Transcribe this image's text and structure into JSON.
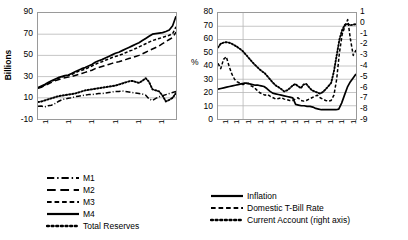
{
  "chart_data": [
    {
      "type": "line",
      "panel": "left",
      "title": "",
      "xlabel": "",
      "ylabel": "Billions",
      "ylim": [
        -10,
        90
      ],
      "yticks": [
        90,
        70,
        50,
        30,
        10,
        -10
      ],
      "grid": true,
      "legend_position": "bottom",
      "x": [
        "1990M1",
        "1990M7",
        "1991M1",
        "1991M7",
        "1992M1",
        "1992M7",
        "1993M1",
        "1993M7",
        "1994M1",
        "1994M7",
        "1995M1",
        "1995M7"
      ],
      "xticks": [
        "1990M1",
        "1991M1",
        "1992M1",
        "1993M1",
        "1994M1",
        "1995M1"
      ],
      "series": [
        {
          "name": "M1",
          "style": "dash-dot",
          "values": [
            2.0,
            2.2,
            1.5,
            2.5,
            3.0,
            4.5,
            6.5,
            8.0,
            9.0,
            9.5,
            10.0,
            11.0,
            11.5,
            12.0,
            12.5,
            13.0,
            13.0,
            13.5,
            14.0,
            14.0,
            14.5,
            15.0,
            15.5,
            16.0,
            16.0,
            16.5,
            16.0,
            15.5,
            15.0,
            14.5,
            14.0,
            13.5,
            12.5,
            9.0,
            7.5,
            9.5,
            11.0,
            12.0,
            13.0,
            14.0,
            15.0,
            16.0
          ]
        },
        {
          "name": "M2",
          "style": "long-dash",
          "values": [
            19.0,
            20.0,
            21.5,
            23.0,
            24.5,
            26.0,
            27.0,
            28.0,
            29.0,
            29.5,
            30.0,
            31.0,
            32.0,
            33.0,
            34.0,
            35.0,
            36.0,
            37.5,
            38.5,
            39.5,
            40.5,
            41.5,
            42.5,
            43.5,
            44.0,
            45.0,
            46.0,
            47.0,
            48.0,
            49.0,
            50.0,
            51.5,
            53.0,
            54.5,
            56.0,
            57.5,
            59.0,
            61.0,
            63.0,
            65.0,
            67.0,
            72.0
          ]
        },
        {
          "name": "M3",
          "style": "dash",
          "values": [
            19.5,
            20.5,
            22.0,
            24.0,
            25.5,
            27.0,
            28.5,
            29.5,
            30.5,
            31.0,
            32.0,
            33.5,
            35.0,
            36.0,
            37.0,
            38.5,
            40.0,
            41.5,
            43.0,
            44.0,
            45.5,
            46.5,
            48.0,
            49.0,
            50.0,
            51.0,
            52.5,
            54.0,
            55.0,
            56.5,
            58.0,
            59.5,
            61.0,
            62.5,
            64.0,
            65.0,
            66.0,
            67.0,
            68.0,
            69.0,
            70.5,
            77.0
          ]
        },
        {
          "name": "M4",
          "style": "solid",
          "values": [
            19.5,
            21.0,
            22.5,
            24.5,
            26.0,
            27.5,
            29.0,
            30.0,
            31.0,
            31.5,
            33.0,
            34.5,
            36.0,
            37.5,
            38.5,
            40.0,
            41.5,
            43.5,
            45.0,
            46.0,
            47.5,
            49.0,
            50.5,
            52.0,
            53.0,
            54.5,
            56.0,
            57.5,
            59.0,
            60.5,
            62.0,
            64.0,
            66.0,
            68.0,
            70.0,
            70.5,
            71.0,
            71.5,
            72.5,
            74.0,
            78.0,
            87.0
          ]
        },
        {
          "name": "Total Reserves",
          "style": "dotted",
          "values": [
            6.0,
            6.5,
            7.5,
            8.5,
            9.5,
            10.5,
            11.5,
            12.0,
            12.5,
            13.0,
            13.5,
            14.0,
            15.0,
            16.0,
            17.0,
            17.5,
            18.0,
            18.5,
            19.0,
            19.5,
            20.0,
            20.5,
            21.0,
            21.5,
            22.5,
            23.5,
            24.5,
            25.5,
            26.0,
            25.0,
            24.0,
            26.0,
            28.5,
            25.0,
            18.0,
            17.0,
            16.0,
            12.0,
            6.5,
            8.0,
            10.0,
            14.5
          ]
        }
      ]
    },
    {
      "type": "line",
      "panel": "right",
      "title": "",
      "xlabel": "",
      "ylabel": "%",
      "y2label": "Billions of U.S. dollars",
      "ylim": [
        0,
        80
      ],
      "yticks": [
        80,
        70,
        60,
        50,
        40,
        30,
        20,
        10,
        0
      ],
      "y2lim": [
        -9,
        1
      ],
      "y2ticks": [
        1,
        0,
        -1,
        -2,
        -3,
        -4,
        -5,
        -6,
        -7,
        -8,
        -9
      ],
      "grid": true,
      "legend_position": "bottom",
      "xticks": [
        "1990M1",
        "1990M7",
        "1991M1",
        "1991M7",
        "1992M1",
        "1992M7",
        "1993M1",
        "1993M7",
        "1994M1",
        "1994M7",
        "1995M1",
        "1995M7"
      ],
      "series": [
        {
          "name": "Inflation",
          "style": "solid",
          "axis": "left",
          "values": [
            22.5,
            23.0,
            23.5,
            24.0,
            24.5,
            25.0,
            25.5,
            26.0,
            26.5,
            27.0,
            27.0,
            26.5,
            26.0,
            25.5,
            25.5,
            25.0,
            24.5,
            23.0,
            21.0,
            19.5,
            19.0,
            18.5,
            18.0,
            17.5,
            17.0,
            16.5,
            16.0,
            11.0,
            10.5,
            10.0,
            10.0,
            9.5,
            9.5,
            9.0,
            8.0,
            7.5,
            7.0,
            7.0,
            7.0,
            7.0,
            7.0,
            7.0,
            7.5,
            12.0,
            18.0,
            24.0,
            28.0,
            31.0,
            34.0
          ]
        },
        {
          "name": "Domestic T-Bill Rate",
          "style": "dash",
          "axis": "left",
          "values": [
            42.0,
            38.0,
            45.0,
            47.0,
            40.0,
            34.0,
            30.0,
            28.0,
            27.0,
            26.0,
            26.5,
            27.0,
            25.0,
            24.0,
            22.0,
            20.0,
            19.0,
            18.0,
            18.5,
            17.0,
            16.0,
            15.0,
            15.5,
            16.0,
            15.0,
            14.5,
            14.0,
            14.0,
            15.0,
            16.0,
            14.0,
            13.5,
            14.0,
            15.0,
            16.0,
            17.0,
            18.0,
            16.0,
            15.0,
            14.0,
            13.5,
            14.0,
            18.0,
            30.0,
            50.0,
            64.0,
            70.0,
            75.0,
            60.0,
            48.0,
            52.0
          ]
        },
        {
          "name": "Current Account (right axis)",
          "style": "dotted",
          "axis": "right",
          "values": [
            -2.25,
            -1.9,
            -1.8,
            -1.75,
            -1.8,
            -1.9,
            -2.05,
            -2.2,
            -2.4,
            -2.6,
            -2.9,
            -3.2,
            -3.5,
            -3.8,
            -4.05,
            -4.3,
            -4.5,
            -4.7,
            -5.0,
            -5.3,
            -5.6,
            -5.85,
            -6.0,
            -6.2,
            -6.4,
            -6.3,
            -6.1,
            -5.85,
            -5.7,
            -5.9,
            -6.1,
            -5.75,
            -5.7,
            -6.0,
            -6.3,
            -6.4,
            -6.5,
            -6.6,
            -6.45,
            -6.2,
            -5.9,
            -5.6,
            -4.5,
            -3.0,
            -1.5,
            -0.6,
            -0.1,
            -0.05,
            -0.15,
            -0.1,
            -0.05
          ]
        }
      ]
    }
  ],
  "left_panel": {
    "ylabel": "Billions",
    "yticks": [
      "90",
      "70",
      "50",
      "30",
      "10",
      "-10"
    ],
    "xticks": [
      "1990M1",
      "1991M1",
      "1992M1",
      "1993M1",
      "1994M1",
      "1995M1"
    ],
    "legend": [
      {
        "label": "M1",
        "style": "dash-dot"
      },
      {
        "label": "M2",
        "style": "long-dash"
      },
      {
        "label": "M3",
        "style": "dash"
      },
      {
        "label": "M4",
        "style": "solid"
      },
      {
        "label": "Total Reserves",
        "style": "dotted"
      }
    ]
  },
  "right_panel": {
    "ylabel": "%",
    "y2label": "Billions of U.S. dollars",
    "yticks": [
      "80",
      "70",
      "60",
      "50",
      "40",
      "30",
      "20",
      "10",
      "0"
    ],
    "y2ticks": [
      "1",
      "0",
      "-1",
      "-2",
      "-3",
      "-4",
      "-5",
      "-6",
      "-7",
      "-8",
      "-9"
    ],
    "xticks": [
      "1990M1",
      "1990M7",
      "1991M1",
      "1991M7",
      "1992M1",
      "1992M7",
      "1993M1",
      "1993M7",
      "1994M1",
      "1994M7",
      "1995M1",
      "1995M7"
    ],
    "legend": [
      {
        "label": "Inflation",
        "style": "solid"
      },
      {
        "label": "Domestic T-Bill Rate",
        "style": "dash"
      },
      {
        "label": "Current Account (right axis)",
        "style": "dotted"
      }
    ]
  }
}
